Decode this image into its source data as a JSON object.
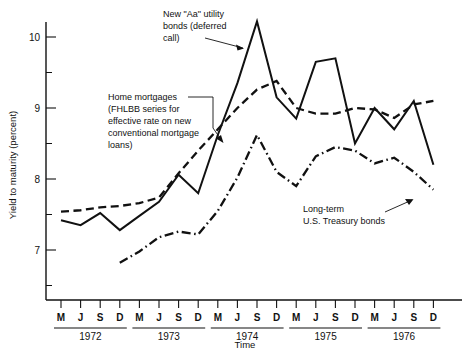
{
  "chart_data": {
    "type": "line",
    "title": "",
    "xlabel": "Time",
    "ylabel": "Yield to maturity (percent)",
    "ylim": [
      6.4,
      10.45
    ],
    "yticks": [
      7,
      8,
      9,
      10
    ],
    "yticks_minor": [
      6.5,
      7.5,
      8.5,
      9.5
    ],
    "grid": false,
    "legend_position": "inline-annotations",
    "x": [
      "M",
      "J",
      "S",
      "D",
      "M",
      "J",
      "S",
      "D",
      "M",
      "J",
      "S",
      "D",
      "M",
      "J",
      "S",
      "D",
      "M",
      "J",
      "S",
      "D"
    ],
    "x_groups": [
      {
        "label": "1972",
        "ticks": [
          "M",
          "J",
          "S",
          "D"
        ]
      },
      {
        "label": "1973",
        "ticks": [
          "M",
          "J",
          "S",
          "D"
        ]
      },
      {
        "label": "1974",
        "ticks": [
          "M",
          "J",
          "S",
          "D"
        ]
      },
      {
        "label": "1975",
        "ticks": [
          "M",
          "J",
          "S",
          "D"
        ]
      },
      {
        "label": "1976",
        "ticks": [
          "M",
          "J",
          "S",
          "D"
        ]
      }
    ],
    "series": [
      {
        "name": "New \"Aa\" utility bonds (deferred call)",
        "style": "solid",
        "values": [
          7.42,
          7.35,
          7.52,
          7.28,
          7.48,
          7.68,
          8.06,
          7.8,
          8.62,
          9.35,
          10.22,
          9.15,
          8.85,
          9.65,
          9.7,
          8.5,
          9.0,
          8.7,
          9.1,
          8.2
        ]
      },
      {
        "name": "Home mortgages (FHLBB series for effective rate on new conventional mortgage loans)",
        "style": "dashed",
        "values": [
          7.54,
          7.56,
          7.6,
          7.62,
          7.66,
          7.74,
          8.08,
          8.4,
          8.7,
          9.0,
          9.26,
          9.38,
          9.0,
          8.92,
          8.92,
          9.0,
          8.98,
          8.86,
          9.05,
          9.1
        ]
      },
      {
        "name": "Long-term U.S. Treasury bonds",
        "style": "dash-dot",
        "values": [
          null,
          null,
          null,
          6.82,
          6.98,
          7.18,
          7.26,
          7.22,
          7.55,
          8.02,
          8.62,
          8.1,
          7.9,
          8.32,
          8.45,
          8.4,
          8.22,
          8.3,
          8.1,
          7.85
        ]
      }
    ],
    "annotations": [
      {
        "id": "annot-utility",
        "text": "New \"Aa\" utility\nbonds (deferred\ncall)"
      },
      {
        "id": "annot-mortgage",
        "text": "Home mortgages\n(FHLBB series for\neffective rate on new\nconventional mortgage\nloans)"
      },
      {
        "id": "annot-treasury",
        "text": "Long-term\nU.S. Treasury bonds"
      }
    ]
  },
  "axis": {
    "y_title": "Yield to maturity (percent)",
    "x_title": "Time",
    "y_labels": [
      "10",
      "9",
      "8",
      "7"
    ],
    "x_tick_labels": [
      "M",
      "J",
      "S",
      "D",
      "M",
      "J",
      "S",
      "D",
      "M",
      "J",
      "S",
      "D",
      "M",
      "J",
      "S",
      "D",
      "M",
      "J",
      "S",
      "D"
    ],
    "year_labels": [
      "1972",
      "1973",
      "1974",
      "1975",
      "1976"
    ]
  },
  "annotations": {
    "utility": {
      "line1": "New \"Aa\" utility",
      "line2": "bonds (deferred",
      "line3": "call)"
    },
    "mortgage": {
      "line1": "Home mortgages",
      "line2": "(FHLBB series for",
      "line3": "effective rate on new",
      "line4": "conventional mortgage",
      "line5": "loans)"
    },
    "treasury": {
      "line1": "Long-term",
      "line2": "U.S. Treasury bonds"
    }
  },
  "colors": {
    "ink": "#111111",
    "background": "#ffffff"
  }
}
